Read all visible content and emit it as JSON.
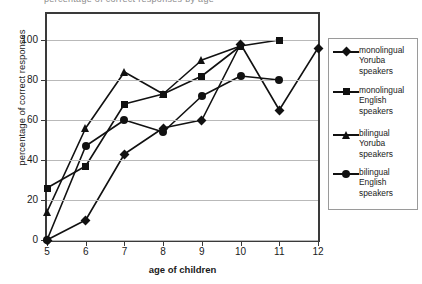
{
  "title_remnant": "percentage of correct responses by age",
  "axes": {
    "ylabel": "percentage of correct responses",
    "xlabel": "age of children",
    "yticks": [
      "0",
      "20",
      "40",
      "60",
      "80",
      "100"
    ],
    "xticks": [
      "5",
      "6",
      "7",
      "8",
      "9",
      "10",
      "11",
      "12"
    ]
  },
  "legend": {
    "items": [
      {
        "label": "monolingual\nYoruba\nspeakers",
        "marker": "diamond",
        "color": "#111111"
      },
      {
        "label": "monolingual\nEnglish\nspeakers",
        "marker": "square",
        "color": "#111111"
      },
      {
        "label": "bilingual\nYoruba\nspeakers",
        "marker": "triangle",
        "color": "#111111"
      },
      {
        "label": "bilingual\nEnglish\nspeakers",
        "marker": "circle",
        "color": "#111111"
      }
    ]
  },
  "chart_data": {
    "type": "line",
    "title": "",
    "xlabel": "age of children",
    "ylabel": "percentage of correct responses",
    "x": [
      5,
      6,
      7,
      8,
      9,
      10,
      11,
      12
    ],
    "xlim": [
      5,
      12
    ],
    "ylim": [
      0,
      113
    ],
    "yticks": [
      0,
      20,
      40,
      60,
      80,
      100
    ],
    "grid": true,
    "legend_position": "right",
    "series": [
      {
        "name": "monolingual Yoruba speakers",
        "marker": "diamond",
        "color": "#111111",
        "x": [
          5,
          6,
          7,
          8,
          9,
          10,
          11,
          12
        ],
        "values": [
          0,
          10,
          43,
          56,
          60,
          98,
          65,
          96
        ]
      },
      {
        "name": "monolingual English speakers",
        "marker": "square",
        "color": "#111111",
        "x": [
          5,
          6,
          7,
          8,
          9,
          10,
          11
        ],
        "values": [
          26,
          37,
          68,
          73,
          82,
          97,
          100
        ]
      },
      {
        "name": "bilingual Yoruba speakers",
        "marker": "triangle",
        "color": "#111111",
        "x": [
          5,
          6,
          7,
          8,
          9,
          10
        ],
        "values": [
          14,
          56,
          84,
          73,
          90,
          97
        ]
      },
      {
        "name": "bilingual English speakers",
        "marker": "circle",
        "color": "#111111",
        "x": [
          5,
          6,
          7,
          8,
          9,
          10,
          11
        ],
        "values": [
          0,
          47,
          60,
          54,
          72,
          82,
          80
        ]
      }
    ]
  }
}
